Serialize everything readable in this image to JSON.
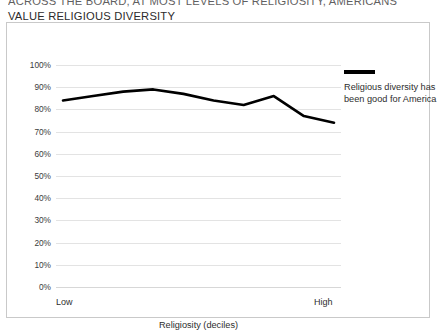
{
  "headline": {
    "line1": "ACROSS THE BOARD, AT MOST LEVELS OF RELIGIOSITY, AMERICANS",
    "line2": "VALUE RELIGIOUS DIVERSITY"
  },
  "legend": {
    "label": "Religious diversity has been good for America",
    "swatch_color": "#000000",
    "icon": "line-swatch"
  },
  "axis": {
    "x_low_label": "Low",
    "x_high_label": "High",
    "x_title": "Religiosity (deciles)"
  },
  "chart_data": {
    "type": "line",
    "title": "ACROSS THE BOARD, AT MOST LEVELS OF RELIGIOSITY, AMERICANS VALUE RELIGIOUS DIVERSITY",
    "xlabel": "Religiosity (deciles)",
    "ylabel": "",
    "ylim": [
      0,
      100
    ],
    "grid": true,
    "legend_position": "right",
    "yticks": [
      "0%",
      "10%",
      "20%",
      "30%",
      "40%",
      "50%",
      "60%",
      "70%",
      "80%",
      "90%",
      "100%"
    ],
    "ytick_values": [
      0,
      10,
      20,
      30,
      40,
      50,
      60,
      70,
      80,
      90,
      100
    ],
    "categories": [
      1,
      2,
      3,
      4,
      5,
      6,
      7,
      8,
      9,
      10
    ],
    "xtick_labels": [
      "Low",
      "",
      "",
      "",
      "",
      "",
      "",
      "",
      "",
      "High"
    ],
    "series": [
      {
        "name": "Religious diversity has been good for America",
        "color": "#000000",
        "values": [
          84,
          86,
          88,
          89,
          87,
          84,
          82,
          86,
          77,
          74
        ]
      }
    ]
  }
}
